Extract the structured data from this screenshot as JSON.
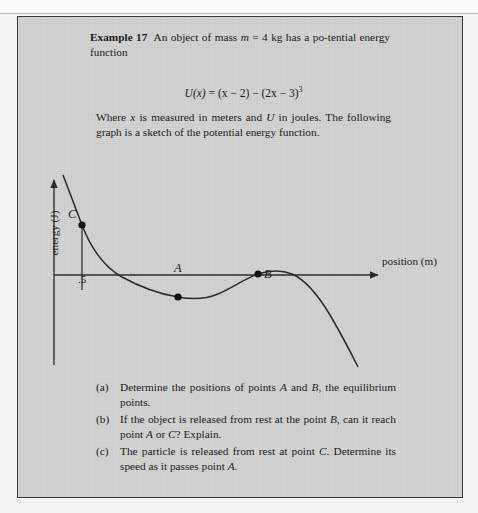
{
  "page": {
    "top_ghost_text": "·                                                                                                              ·"
  },
  "example": {
    "label": "Example 17",
    "statement_part1": "An object of mass ",
    "mass_symbol": "m",
    "mass_value": " = 4 kg has a po-tential energy function",
    "formula_lhs": "U",
    "formula_var": "(x)",
    "formula_rhs_a": " = (x − 2) − (2x − 3)",
    "formula_exponent": "3",
    "where_text_a": "Where ",
    "where_var_x": "x",
    "where_text_b": " is measured in meters and ",
    "where_var_U": "U",
    "where_text_c": " in joules. The following graph is a sketch of the potential energy function."
  },
  "graph": {
    "x_axis_label": "position (m)",
    "y_axis_label": "energy (J)",
    "tick_label": ".5",
    "point_c_label": "C",
    "point_a_label": "A",
    "point_b_label": "B"
  },
  "chart_data": {
    "type": "line",
    "title": "",
    "xlabel": "position (m)",
    "ylabel": "energy (J)",
    "grid": false,
    "legend": "none",
    "axis_origin_note": "y-axis drawn at left; x-axis is the U = 0 line",
    "curve_description": "Potential energy U(x) = (x - 2) - (2x - 3)^3: steeply decreasing from upper left, crossing zero, reaching a local minimum at A, rising to a local maximum at B, then falling steeply to the lower right.",
    "annotated_points": [
      {
        "label": "C",
        "role": "release point on curve above axis",
        "x_tick": ".5"
      },
      {
        "label": "A",
        "role": "local minimum / stable equilibrium"
      },
      {
        "label": "B",
        "role": "local maximum / unstable equilibrium"
      }
    ],
    "x": [
      0.15,
      0.25,
      0.35,
      0.5,
      0.62,
      0.75,
      0.9,
      1.05,
      1.2,
      1.35,
      1.5,
      1.65,
      1.8,
      1.95,
      2.1,
      2.25,
      2.4,
      2.55,
      2.7,
      2.85,
      3.0
    ],
    "y": [
      1.75,
      1.48,
      1.2,
      0.86,
      0.6,
      0.35,
      0.1,
      -0.1,
      -0.25,
      -0.36,
      -0.42,
      -0.44,
      -0.42,
      -0.34,
      -0.22,
      -0.1,
      -0.02,
      -0.05,
      -0.2,
      -0.55,
      -1.1
    ]
  },
  "questions": [
    {
      "marker": "(a)",
      "parts": [
        {
          "t": "Determine the positions of points ",
          "i": false
        },
        {
          "t": "A",
          "i": true
        },
        {
          "t": " and ",
          "i": false
        },
        {
          "t": "B",
          "i": true
        },
        {
          "t": ", the equilibrium points.",
          "i": false
        }
      ]
    },
    {
      "marker": "(b)",
      "parts": [
        {
          "t": "If the object is released from rest at the point ",
          "i": false
        },
        {
          "t": "B",
          "i": true
        },
        {
          "t": ", can it reach point ",
          "i": false
        },
        {
          "t": "A",
          "i": true
        },
        {
          "t": " or ",
          "i": false
        },
        {
          "t": "C",
          "i": true
        },
        {
          "t": "? Explain.",
          "i": false
        }
      ]
    },
    {
      "marker": "(c)",
      "parts": [
        {
          "t": "The particle is released from rest at point ",
          "i": false
        },
        {
          "t": "C",
          "i": true
        },
        {
          "t": ". Determine its speed as it passes point ",
          "i": false
        },
        {
          "t": "A",
          "i": true
        },
        {
          "t": ".",
          "i": false
        }
      ]
    }
  ]
}
